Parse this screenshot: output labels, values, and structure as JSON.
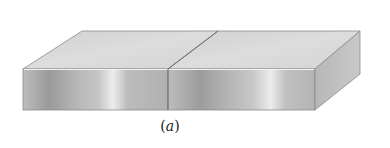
{
  "figure": {
    "caption_open": "(",
    "caption_letter": "a",
    "caption_close": ")",
    "colors": {
      "top_face": "#d6d6d6",
      "front_face_dark": "#9c9c9c",
      "front_face_light": "#e6e6e6",
      "side_face": "#b4b4b4",
      "edge": "#7a7a7a",
      "highlight_edge": "#f2f2f2"
    }
  }
}
